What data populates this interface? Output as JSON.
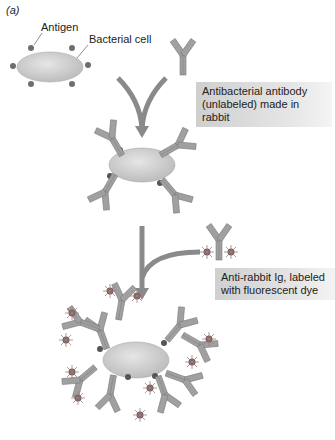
{
  "figure": {
    "panel_label": "(a)",
    "labels": {
      "antigen": "Antigen",
      "bacterial_cell": "Bacterial cell"
    },
    "step1": {
      "line1": "Antibacterial antibody",
      "line2": "(unlabeled) made in rabbit"
    },
    "step2": {
      "line1": "Anti-rabbit Ig, labeled",
      "line2": "with fluorescent dye"
    }
  },
  "colors": {
    "cell": "#c9c9c9",
    "antibody": "#9a9a9a",
    "antigen": "#6e6e6e",
    "fluor": "#7a5a5a",
    "arrow": "#8a8a8a",
    "box": "#d8d8d8"
  }
}
